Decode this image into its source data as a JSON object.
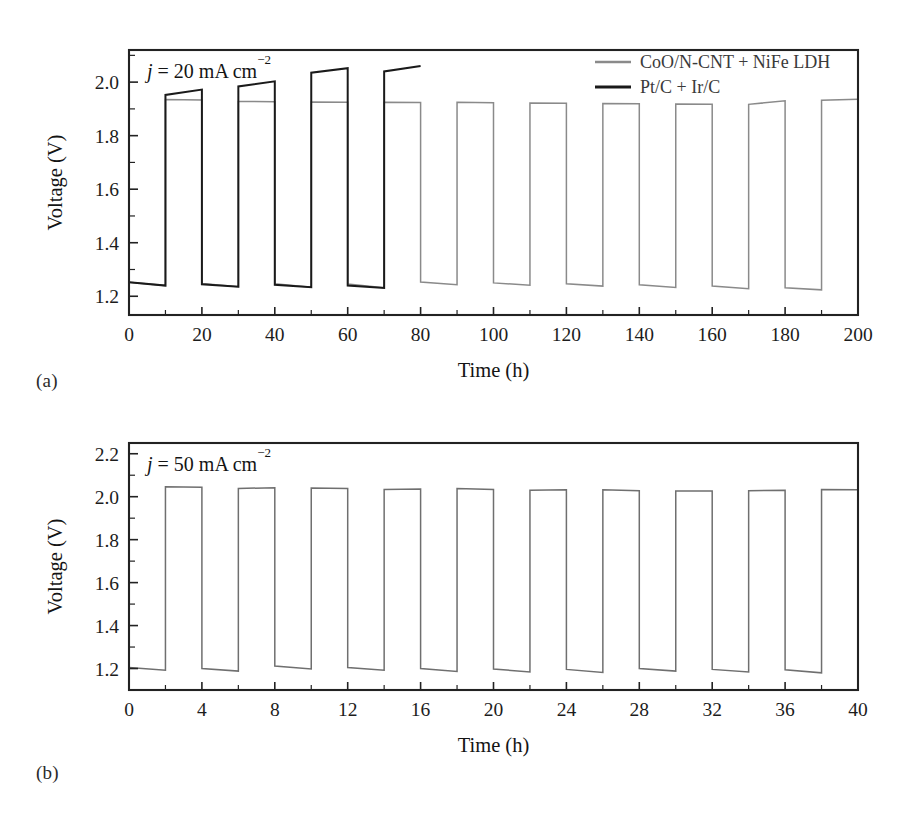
{
  "figure": {
    "panel_a_label": "(a)",
    "panel_b_label": "(b)"
  },
  "chart_data": [
    {
      "id": "panel-a",
      "type": "line",
      "title": "",
      "annotation": "j = 20 mA cm−2",
      "annotation_italic_symbol": "j",
      "annotation_rest": " = 20 mA cm",
      "annotation_superscript": "−2",
      "xlabel": "Time (h)",
      "ylabel": "Voltage (V)",
      "xlim": [
        0,
        200
      ],
      "ylim": [
        1.13,
        2.12
      ],
      "xticks": [
        0,
        20,
        40,
        60,
        80,
        100,
        120,
        140,
        160,
        180,
        200
      ],
      "xticklabels": [
        "0",
        "20",
        "40",
        "60",
        "80",
        "100",
        "120",
        "140",
        "160",
        "180",
        "200"
      ],
      "xminor_step": 10,
      "yticks": [
        1.2,
        1.4,
        1.6,
        1.8,
        2.0
      ],
      "yticklabels": [
        "1.2",
        "1.4",
        "1.6",
        "1.8",
        "2.0"
      ],
      "yminor_step": 0.1,
      "grid": false,
      "legend_position": "top-right",
      "series": [
        {
          "name": "CoO/N-CNT + NiFe LDH",
          "color": "#8a8a8a",
          "width": 1.5,
          "cycle_period": 20,
          "half_cycle": 10,
          "start_time": 0,
          "end_time": 200,
          "first_state": "discharge",
          "charge_start": [
            1.935,
            1.928,
            1.926,
            1.925,
            1.925,
            1.922,
            1.92,
            1.918,
            1.917,
            1.932
          ],
          "charge_end": [
            1.933,
            1.927,
            1.925,
            1.924,
            1.923,
            1.921,
            1.919,
            1.917,
            1.93,
            1.936
          ],
          "discharge_start": [
            1.252,
            1.248,
            1.247,
            1.246,
            1.253,
            1.25,
            1.247,
            1.243,
            1.238,
            1.232,
            1.238
          ],
          "discharge_end": [
            1.24,
            1.236,
            1.234,
            1.232,
            1.243,
            1.241,
            1.238,
            1.233,
            1.228,
            1.224,
            1.228
          ]
        },
        {
          "name": "Pt/C + Ir/C",
          "color": "#1a1a1a",
          "width": 2.0,
          "cycle_period": 20,
          "half_cycle": 10,
          "start_time": 0,
          "end_time": 80,
          "first_state": "discharge",
          "charge_start": [
            1.952,
            1.984,
            2.035,
            2.04
          ],
          "charge_end": [
            1.972,
            2.003,
            2.052,
            2.06
          ],
          "discharge_start": [
            1.252,
            1.245,
            1.243,
            1.24
          ],
          "discharge_end": [
            1.24,
            1.236,
            1.234,
            1.231
          ]
        }
      ]
    },
    {
      "id": "panel-b",
      "type": "line",
      "title": "",
      "annotation": "j = 50 mA cm−2",
      "annotation_italic_symbol": "j",
      "annotation_rest": " = 50 mA cm",
      "annotation_superscript": "−2",
      "xlabel": "Time (h)",
      "ylabel": "Voltage (V)",
      "xlim": [
        0,
        40
      ],
      "ylim": [
        1.1,
        2.25
      ],
      "xticks": [
        0,
        4,
        8,
        12,
        16,
        20,
        24,
        28,
        32,
        36,
        40
      ],
      "xticklabels": [
        "0",
        "4",
        "8",
        "12",
        "16",
        "20",
        "24",
        "28",
        "32",
        "36",
        "40"
      ],
      "xminor_step": 2,
      "yticks": [
        1.2,
        1.4,
        1.6,
        1.8,
        2.0,
        2.2
      ],
      "yticklabels": [
        "1.2",
        "1.4",
        "1.6",
        "1.8",
        "2.0",
        "2.2"
      ],
      "yminor_step": 0.1,
      "grid": false,
      "legend_position": "none",
      "series": [
        {
          "name": "CoO/N-CNT + NiFe LDH",
          "color": "#6f6f6f",
          "width": 1.5,
          "cycle_period": 4,
          "half_cycle": 2,
          "start_time": 0,
          "end_time": 40,
          "first_state": "discharge",
          "charge_start": [
            2.046,
            2.038,
            2.04,
            2.034,
            2.038,
            2.03,
            2.032,
            2.026,
            2.028,
            2.034
          ],
          "charge_end": [
            2.044,
            2.042,
            2.038,
            2.036,
            2.034,
            2.032,
            2.028,
            2.026,
            2.03,
            2.032
          ],
          "discharge_start": [
            1.205,
            1.2,
            1.212,
            1.205,
            1.2,
            1.198,
            1.196,
            1.2,
            1.196,
            1.194,
            1.196
          ],
          "discharge_end": [
            1.192,
            1.188,
            1.198,
            1.192,
            1.186,
            1.184,
            1.182,
            1.188,
            1.184,
            1.18,
            1.184
          ]
        }
      ]
    }
  ]
}
